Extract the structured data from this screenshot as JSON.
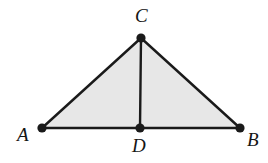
{
  "figure": {
    "name": "triangle-with-altitude",
    "canvas": {
      "width": 268,
      "height": 163
    },
    "style": {
      "background_color": "#ffffff",
      "fill_color": "#e7e7e7",
      "stroke_color": "#1a1a1a",
      "stroke_width": 2.4,
      "vertex_dot_color": "#1a1a1a",
      "vertex_dot_radius": 4.6,
      "label_color": "#151515"
    },
    "points": [
      {
        "id": "A",
        "label": "A",
        "x": 42,
        "y": 128,
        "label_x": 17,
        "label_y": 125
      },
      {
        "id": "B",
        "label": "B",
        "x": 240,
        "y": 128,
        "label_x": 247,
        "label_y": 130
      },
      {
        "id": "C",
        "label": "C",
        "x": 141,
        "y": 38,
        "label_x": 135,
        "label_y": 6
      },
      {
        "id": "D",
        "label": "D",
        "x": 140,
        "y": 128,
        "label_x": 132,
        "label_y": 136
      }
    ],
    "segments": [
      {
        "id": "AB",
        "from": "A",
        "to": "B"
      },
      {
        "id": "AC",
        "from": "A",
        "to": "C"
      },
      {
        "id": "BC",
        "from": "B",
        "to": "C"
      },
      {
        "id": "CD",
        "from": "C",
        "to": "D"
      }
    ],
    "polygon": {
      "id": "triangle-ABC",
      "vertices": [
        "A",
        "C",
        "B"
      ],
      "points_attr": "42,128 141,38 240,128"
    }
  }
}
